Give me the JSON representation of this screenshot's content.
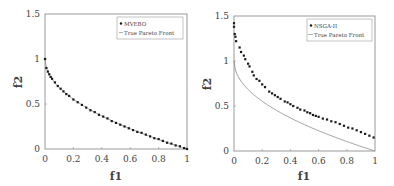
{
  "chart_data": [
    {
      "type": "scatter",
      "title": "",
      "xlabel": "f1",
      "ylabel": "f2",
      "xlim": [
        0,
        1
      ],
      "ylim": [
        0,
        1.5
      ],
      "xticks": [
        "0",
        "0.2",
        "0.4",
        "0.6",
        "0.8",
        "1"
      ],
      "yticks": [
        "0",
        "0.5",
        "1",
        "1.5"
      ],
      "grid": false,
      "legend_position": "upper right",
      "legend": [
        "MVEBO",
        "True Pareto Front"
      ],
      "series": [
        {
          "name": "MVEBO",
          "style": "markers",
          "x": [
            0,
            0.01,
            0.02,
            0.03,
            0.04,
            0.05,
            0.07,
            0.09,
            0.11,
            0.13,
            0.15,
            0.17,
            0.2,
            0.23,
            0.26,
            0.29,
            0.32,
            0.35,
            0.38,
            0.41,
            0.44,
            0.47,
            0.5,
            0.53,
            0.56,
            0.59,
            0.62,
            0.65,
            0.68,
            0.71,
            0.74,
            0.77,
            0.8,
            0.83,
            0.86,
            0.89,
            0.92,
            0.95,
            0.98,
            1.0
          ],
          "y": [
            1.0,
            0.9,
            0.86,
            0.83,
            0.8,
            0.78,
            0.74,
            0.7,
            0.67,
            0.64,
            0.61,
            0.59,
            0.55,
            0.52,
            0.49,
            0.46,
            0.43,
            0.41,
            0.38,
            0.36,
            0.34,
            0.31,
            0.29,
            0.27,
            0.25,
            0.23,
            0.21,
            0.19,
            0.18,
            0.16,
            0.14,
            0.12,
            0.11,
            0.09,
            0.07,
            0.06,
            0.04,
            0.03,
            0.01,
            0.0
          ]
        },
        {
          "name": "True Pareto Front",
          "style": "line",
          "function": "f2 = 1 - sqrt(f1)",
          "x": [
            0,
            0.2,
            0.4,
            0.6,
            0.8,
            1.0
          ],
          "y": [
            1.0,
            0.553,
            0.368,
            0.225,
            0.106,
            0.0
          ]
        }
      ]
    },
    {
      "type": "scatter",
      "title": "",
      "xlabel": "f1",
      "ylabel": "f2",
      "xlim": [
        0,
        1
      ],
      "ylim": [
        0,
        1.5
      ],
      "xticks": [
        "0",
        "0.2",
        "0.4",
        "0.6",
        "0.8",
        "1"
      ],
      "yticks": [
        "0",
        "0.5",
        "1",
        "1.5"
      ],
      "grid": false,
      "legend_position": "upper right",
      "legend": [
        "NSGA-II",
        "True Pareto Front"
      ],
      "series": [
        {
          "name": "NSGA-II",
          "style": "markers",
          "x": [
            0,
            0.0,
            0.005,
            0.01,
            0.015,
            0.04,
            0.05,
            0.07,
            0.08,
            0.1,
            0.11,
            0.13,
            0.14,
            0.16,
            0.18,
            0.2,
            0.22,
            0.25,
            0.27,
            0.29,
            0.31,
            0.33,
            0.36,
            0.38,
            0.4,
            0.42,
            0.45,
            0.47,
            0.5,
            0.52,
            0.54,
            0.56,
            0.58,
            0.6,
            0.63,
            0.66,
            0.69,
            0.72,
            0.75,
            0.78,
            0.81,
            0.84,
            0.87,
            0.9,
            0.93,
            0.96,
            0.99
          ],
          "y": [
            1.42,
            1.38,
            1.3,
            1.27,
            1.22,
            1.15,
            1.1,
            1.06,
            1.02,
            0.97,
            0.94,
            0.88,
            0.84,
            0.8,
            0.78,
            0.74,
            0.71,
            0.66,
            0.64,
            0.62,
            0.6,
            0.58,
            0.55,
            0.54,
            0.52,
            0.5,
            0.48,
            0.46,
            0.45,
            0.43,
            0.42,
            0.4,
            0.39,
            0.38,
            0.36,
            0.35,
            0.33,
            0.32,
            0.3,
            0.28,
            0.26,
            0.25,
            0.23,
            0.21,
            0.19,
            0.17,
            0.15
          ]
        },
        {
          "name": "True Pareto Front",
          "style": "line",
          "function": "f2 = 1 - sqrt(f1)",
          "x": [
            0,
            0.2,
            0.4,
            0.6,
            0.8,
            1.0
          ],
          "y": [
            1.0,
            0.553,
            0.368,
            0.225,
            0.106,
            0.0
          ]
        }
      ]
    }
  ],
  "charts": {
    "left": {
      "xlabel": "f1",
      "ylabel": "f2",
      "xticks": [
        "0",
        "0.2",
        "0.4",
        "0.6",
        "0.8",
        "1"
      ],
      "yticks": [
        "0",
        "0.5",
        "1",
        "1.5"
      ],
      "legend_marker_label": "MVEBO",
      "legend_line_label": "True Pareto Front"
    },
    "right": {
      "xlabel": "f1",
      "ylabel": "f2",
      "xticks": [
        "0",
        "0.2",
        "0.4",
        "0.6",
        "0.8",
        "1"
      ],
      "yticks": [
        "0",
        "0.5",
        "1",
        "1.5"
      ],
      "legend_marker_label": "NSGA-II",
      "legend_line_label": "True Pareto Front"
    }
  },
  "colors": {
    "axis": "#999999",
    "marker": "#1a1a1a",
    "true_front": "#8a8a8a",
    "text": "#444444"
  }
}
